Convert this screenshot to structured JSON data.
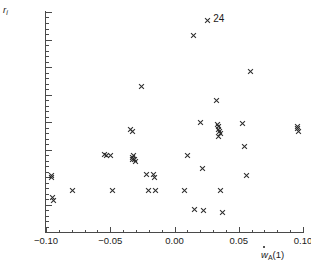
{
  "chart_data": {
    "type": "scatter",
    "title": "",
    "xlabel": "ẇ_A(1)",
    "ylabel": "r_i",
    "xlim": [
      -0.1,
      0.1
    ],
    "ylim": [
      -0.3,
      0.5
    ],
    "grid": false,
    "legend": null,
    "marker": "x",
    "marker_color": "#2b2b2b",
    "xticks": [
      -0.1,
      -0.05,
      0.0,
      0.05,
      0.1
    ],
    "xticklabels": [
      "−0.10",
      "−0.05",
      "0.00",
      "0.05",
      "0.10"
    ],
    "xminor_step": 0.01,
    "yticks": [
      -0.3,
      -0.2,
      -0.1,
      0.0,
      0.1,
      0.2,
      0.3,
      0.4,
      0.5
    ],
    "yticklabels": [
      "−0.3",
      "−0.2",
      "−0.1",
      "0.0",
      "0.1",
      "0.2",
      "0.3",
      "0.4",
      "0.5"
    ],
    "yminor_step": 0.02,
    "annotations": [
      {
        "text": "24",
        "x": 0.0255,
        "y": 0.468
      }
    ],
    "points": [
      {
        "x": -0.0955,
        "y": -0.093
      },
      {
        "x": -0.0955,
        "y": -0.103
      },
      {
        "x": -0.095,
        "y": -0.175
      },
      {
        "x": -0.0945,
        "y": -0.187
      },
      {
        "x": -0.079,
        "y": -0.148
      },
      {
        "x": -0.0545,
        "y": -0.018
      },
      {
        "x": -0.053,
        "y": -0.022
      },
      {
        "x": -0.05,
        "y": -0.021
      },
      {
        "x": -0.048,
        "y": -0.15
      },
      {
        "x": -0.0345,
        "y": 0.074
      },
      {
        "x": -0.033,
        "y": 0.064
      },
      {
        "x": -0.032,
        "y": -0.02
      },
      {
        "x": -0.0325,
        "y": -0.03
      },
      {
        "x": -0.033,
        "y": -0.038
      },
      {
        "x": -0.031,
        "y": -0.037
      },
      {
        "x": -0.0305,
        "y": -0.042
      },
      {
        "x": -0.0255,
        "y": 0.228
      },
      {
        "x": -0.0215,
        "y": -0.092
      },
      {
        "x": -0.0205,
        "y": -0.148
      },
      {
        "x": -0.016,
        "y": -0.09
      },
      {
        "x": -0.0155,
        "y": -0.1
      },
      {
        "x": -0.0145,
        "y": -0.148
      },
      {
        "x": 0.008,
        "y": -0.15
      },
      {
        "x": 0.01,
        "y": -0.02
      },
      {
        "x": 0.0145,
        "y": 0.413
      },
      {
        "x": 0.0155,
        "y": -0.218
      },
      {
        "x": 0.02,
        "y": 0.1
      },
      {
        "x": 0.0215,
        "y": -0.068
      },
      {
        "x": 0.0225,
        "y": -0.222
      },
      {
        "x": 0.0255,
        "y": 0.47
      },
      {
        "x": 0.033,
        "y": 0.178
      },
      {
        "x": 0.0335,
        "y": 0.092
      },
      {
        "x": 0.034,
        "y": 0.082
      },
      {
        "x": 0.0345,
        "y": 0.073
      },
      {
        "x": 0.035,
        "y": 0.066
      },
      {
        "x": 0.0355,
        "y": 0.058
      },
      {
        "x": 0.0345,
        "y": 0.048
      },
      {
        "x": 0.036,
        "y": -0.148
      },
      {
        "x": 0.037,
        "y": -0.228
      },
      {
        "x": 0.053,
        "y": 0.093
      },
      {
        "x": 0.0545,
        "y": 0.01
      },
      {
        "x": 0.056,
        "y": -0.095
      },
      {
        "x": 0.0595,
        "y": 0.282
      },
      {
        "x": 0.0955,
        "y": 0.085
      },
      {
        "x": 0.096,
        "y": 0.075
      },
      {
        "x": 0.0965,
        "y": 0.066
      }
    ]
  },
  "axes": {
    "y_title_main": "r",
    "y_title_sub": "i",
    "x_title_w": "w",
    "x_title_sub": "A",
    "x_title_tail": "(1)"
  }
}
